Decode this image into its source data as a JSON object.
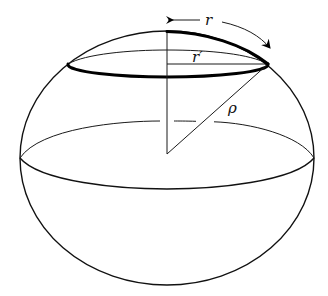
{
  "diagram": {
    "title": "",
    "labels": {
      "geodesic_radius": "r",
      "euclidean_radius": "r′",
      "sphere_radius": "ρ"
    },
    "colors": {
      "stroke": "#000000",
      "background": "#ffffff"
    }
  }
}
